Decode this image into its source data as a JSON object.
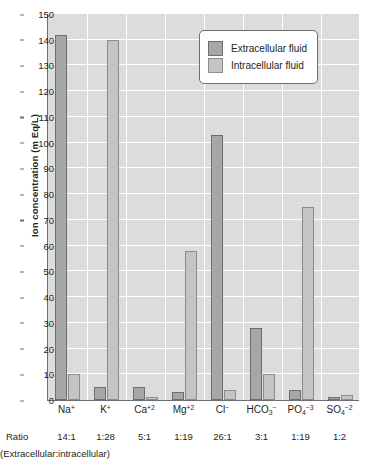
{
  "chart_data": {
    "type": "bar",
    "title": "",
    "xlabel": "",
    "ylabel": "Ion concentration (m Eq/L)",
    "ylim": [
      0,
      150
    ],
    "ytick_step": 10,
    "yticks": [
      0,
      10,
      20,
      30,
      40,
      50,
      60,
      70,
      80,
      90,
      100,
      110,
      120,
      130,
      140,
      150
    ],
    "grid": true,
    "legend_position": "top-right",
    "categories": [
      "Na+",
      "K+",
      "Ca+2",
      "Mg+2",
      "Cl-",
      "HCO3-",
      "PO4-3",
      "SO4-2"
    ],
    "category_labels_html": [
      "Na<sup>+</sup>",
      "K<sup>+</sup>",
      "Ca<sup>+2</sup>",
      "Mg<sup>+2</sup>",
      "Cl<sup>&#8722;</sup>",
      "HCO<span class=\"sub\">3</span><sup>&#8722;</sup>",
      "PO<span class=\"sub\">4</span><sup>&#8722;3</sup>",
      "SO<span class=\"sub\">4</span><sup>&#8722;2</sup>"
    ],
    "series": [
      {
        "name": "Extracellular fluid",
        "color": "#a6a7a9",
        "values": [
          142,
          5,
          5,
          3,
          103,
          28,
          4,
          1
        ]
      },
      {
        "name": "Intracellular fluid",
        "color": "#c3c4c6",
        "values": [
          10,
          140,
          1,
          58,
          4,
          10,
          75,
          2
        ]
      }
    ],
    "ratios": [
      "14:1",
      "1:28",
      "5:1",
      "1:19",
      "26:1",
      "3:1",
      "1:19",
      "1:2"
    ],
    "ratio_label": "Ratio",
    "ratio_caption": "(Extracellular:intracellular)",
    "annotations": []
  },
  "legend": {
    "items": [
      {
        "label": "Extracellular fluid",
        "swatch": "extra"
      },
      {
        "label": "Intracellular fluid",
        "swatch": "intra"
      }
    ]
  },
  "colors": {
    "plot_background": "#dcdcdc",
    "gridline": "#ffffff",
    "axis": "#6d6e71",
    "extracellular": "#a6a7a9",
    "intracellular": "#c3c4c6",
    "text": "#231f20"
  }
}
